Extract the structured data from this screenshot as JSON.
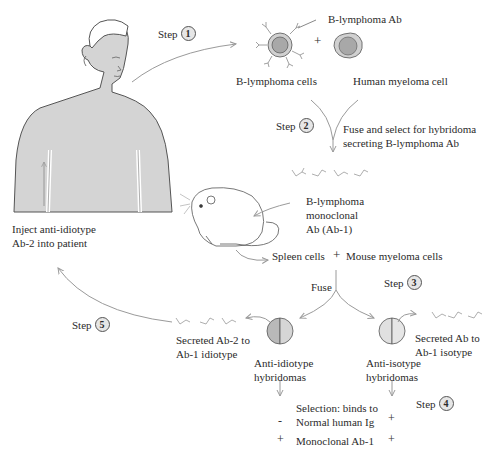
{
  "diagram": {
    "type": "process-flow",
    "title": "",
    "colors": {
      "skin": "#d4d4d4",
      "outline": "#555555",
      "arrow": "#9a9a9a",
      "cell_outer": "#d0d0d0",
      "cell_nucleus": "#a8a8a8",
      "hybridoma_dark": "#b9b9b9",
      "hybridoma_light": "#e3e3e3"
    },
    "steps": [
      {
        "id": "step-1",
        "label": "Step",
        "number": "1"
      },
      {
        "id": "step-2",
        "label": "Step",
        "number": "2"
      },
      {
        "id": "step-3",
        "label": "Step",
        "number": "3"
      },
      {
        "id": "step-4",
        "label": "Step",
        "number": "4"
      },
      {
        "id": "step-5",
        "label": "Step",
        "number": "5"
      }
    ],
    "labels": {
      "b_lymphoma_ab": "B-lymphoma Ab",
      "plus_1": "+",
      "b_lymphoma_cells": "B-lymphoma cells",
      "human_myeloma_cell": "Human myeloma cell",
      "fuse_select_1": "Fuse and select for hybridoma",
      "fuse_select_2": "secreting B-lymphoma Ab",
      "mono_1": "B-lymphoma",
      "mono_2": "monoclonal",
      "mono_3": "Ab (Ab-1)",
      "spleen_cells": "Spleen cells",
      "plus_2": "+",
      "mouse_myeloma": "Mouse myeloma cells",
      "fuse": "Fuse",
      "inject_1": "Inject anti-idiotype",
      "inject_2": "Ab-2 into patient",
      "secreted_ab2_1": "Secreted Ab-2 to",
      "secreted_ab2_2": "Ab-1 idiotype",
      "secreted_ab_1": "Secreted Ab to",
      "secreted_ab_2": "Ab-1 isotype",
      "anti_idiotype_1": "Anti-idiotype",
      "anti_idiotype_2": "hybridomas",
      "anti_isotype_1": "Anti-isotype",
      "anti_isotype_2": "hybridomas",
      "selection_1": "Selection: binds to",
      "selection_2": "Normal human Ig",
      "selection_3": "Monoclonal Ab-1"
    },
    "selection_table": {
      "rows": [
        {
          "criterion": "Normal human Ig",
          "anti_idiotype": "-",
          "anti_isotype": "+"
        },
        {
          "criterion": "Monoclonal Ab-1",
          "anti_idiotype": "+",
          "anti_isotype": "+"
        }
      ]
    }
  }
}
